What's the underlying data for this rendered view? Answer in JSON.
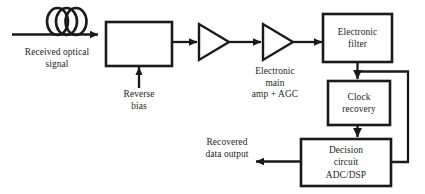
{
  "diagram": {
    "type": "block-diagram",
    "stroke_color": "#1a1a1a",
    "text_color": "#231f20",
    "background": "#ffffff",
    "nodes": {
      "fiber_coil": {
        "name": "optical fiber coil",
        "label": ""
      },
      "photodetector": {
        "label": ""
      },
      "preamp": {
        "label": ""
      },
      "main_amp": {
        "label": ""
      },
      "electronic_filter": {
        "label": "Electronic\nfilter"
      },
      "clock_recovery": {
        "label": "Clock\nrecovery"
      },
      "decision_circuit": {
        "label": "Decision\ncircuit\nADC/DSP"
      }
    },
    "labels": {
      "received_optical_signal": "Received optical\nsignal",
      "reverse_bias": "Reverse\nbias",
      "electronic_main_amp": "Electronic\nmain\namp + AGC",
      "recovered_data_output": "Recovered\ndata output"
    }
  }
}
